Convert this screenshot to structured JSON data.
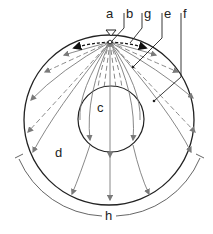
{
  "diagram": {
    "type": "seismic-wave-propagation-through-earth",
    "labels": {
      "a": "a",
      "b": "b",
      "g": "g",
      "e": "e",
      "f": "f",
      "c": "c",
      "d": "d",
      "h": "h"
    },
    "label_positions": {
      "a": [
        110,
        18
      ],
      "b": [
        127,
        18
      ],
      "g": [
        145,
        18
      ],
      "e": [
        165,
        18
      ],
      "f": [
        184,
        18
      ],
      "c": [
        102,
        112
      ],
      "d": [
        58,
        155
      ],
      "h": [
        108,
        220
      ]
    },
    "outer_circle": {
      "cx": 109,
      "cy": 120,
      "r": 85
    },
    "inner_circle": {
      "cx": 111,
      "cy": 119,
      "r": 33
    },
    "source_point": {
      "x": 110,
      "y": 42
    },
    "source_marker": "inverted-triangle",
    "shadow_zone_bracket": {
      "label": "h"
    },
    "colors": {
      "outline": "#222222",
      "ray": "#7a7a7a",
      "surface_wave": "#111111",
      "label": "#222222"
    }
  }
}
